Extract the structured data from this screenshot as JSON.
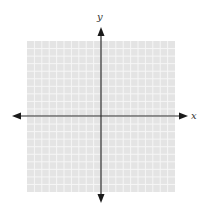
{
  "diagram": {
    "type": "coordinate-plane",
    "x_axis_label": "x",
    "y_axis_label": "y",
    "grid": {
      "columns": 20,
      "rows": 20,
      "fill_color": "#e4e4e4",
      "line_color": "#f6f6f6"
    },
    "axis_color": "#2a2a2a",
    "tick_labels": []
  }
}
